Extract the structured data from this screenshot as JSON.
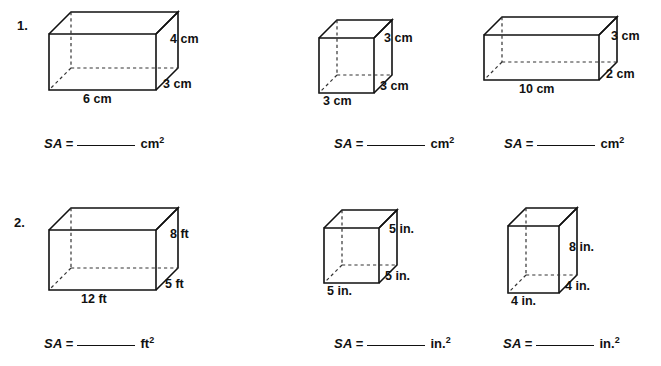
{
  "worksheet": {
    "title": "Surface Area of Rectangular Prisms Worksheet",
    "ink_color": "#111111",
    "background_color": "#ffffff"
  },
  "problems": [
    {
      "number": "1.",
      "unit": "cm",
      "exponent": "2",
      "figures": [
        {
          "name": "rectangular-prism-6x3x4-cm",
          "shape": "rectangular-prism",
          "width_label": "6 cm",
          "depth_label": "3 cm",
          "height_label": "4 cm",
          "sa_label": "SA",
          "equals": "=",
          "unit_label": "cm",
          "unit_exponent": "2"
        },
        {
          "name": "cube-3x3x3-cm",
          "shape": "cube",
          "width_label": "3 cm",
          "depth_label": "3 cm",
          "height_label": "3 cm",
          "sa_label": "SA",
          "equals": "=",
          "unit_label": "cm",
          "unit_exponent": "2"
        },
        {
          "name": "rectangular-prism-10x2x3-cm",
          "shape": "rectangular-prism",
          "width_label": "10 cm",
          "depth_label": "2 cm",
          "height_label": "3 cm",
          "sa_label": "SA",
          "equals": "=",
          "unit_label": "cm",
          "unit_exponent": "2"
        }
      ]
    },
    {
      "number": "2.",
      "unit": "ft",
      "exponent": "2",
      "figures": [
        {
          "name": "rectangular-prism-12x5x8-ft",
          "shape": "rectangular-prism",
          "width_label": "12 ft",
          "depth_label": "5 ft",
          "height_label": "8 ft",
          "sa_label": "SA",
          "equals": "=",
          "unit_label": "ft",
          "unit_exponent": "2"
        },
        {
          "name": "cube-5x5x5-in",
          "shape": "cube",
          "width_label": "5 in.",
          "depth_label": "5 in.",
          "height_label": "5 in.",
          "sa_label": "SA",
          "equals": "=",
          "unit_label": "in.",
          "unit_exponent": "2"
        },
        {
          "name": "rectangular-prism-4x4x8-in",
          "shape": "rectangular-prism",
          "width_label": "4 in.",
          "depth_label": "4 in.",
          "height_label": "8 in.",
          "sa_label": "SA",
          "equals": "=",
          "unit_label": "in.",
          "unit_exponent": "2"
        }
      ]
    }
  ]
}
